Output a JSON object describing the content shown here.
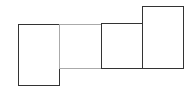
{
  "diagram": {
    "type": "rectangles",
    "boxes": [
      {
        "id": "box-1",
        "x": 18,
        "y": 24,
        "w": 42,
        "h": 62,
        "stroke": "#333333",
        "width": 1.5
      },
      {
        "id": "box-2",
        "x": 59,
        "y": 24,
        "w": 43,
        "h": 45,
        "stroke": "#aaaaaa",
        "width": 1
      },
      {
        "id": "box-3",
        "x": 101,
        "y": 23,
        "w": 42,
        "h": 46,
        "stroke": "#333333",
        "width": 1.5
      },
      {
        "id": "box-4",
        "x": 142,
        "y": 6,
        "w": 42,
        "h": 63,
        "stroke": "#333333",
        "width": 1.5
      }
    ]
  }
}
